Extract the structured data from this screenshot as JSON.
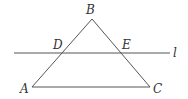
{
  "diagram": {
    "type": "geometry",
    "points": {
      "A": {
        "label": "A",
        "x": 32,
        "y": 87
      },
      "B": {
        "label": "B",
        "x": 92,
        "y": 19
      },
      "C": {
        "label": "C",
        "x": 150,
        "y": 87
      },
      "D": {
        "label": "D",
        "x": 62,
        "y": 53
      },
      "E": {
        "label": "E",
        "x": 121,
        "y": 53
      }
    },
    "line_l": {
      "label": "l",
      "x1": 14,
      "y1": 53,
      "x2": 170,
      "y2": 53
    },
    "labels": {
      "A": "A",
      "B": "B",
      "C": "C",
      "D": "D",
      "E": "E",
      "l": "l"
    },
    "colors": {
      "stroke": "#555555",
      "text": "#333333",
      "background": "#ffffff"
    }
  }
}
